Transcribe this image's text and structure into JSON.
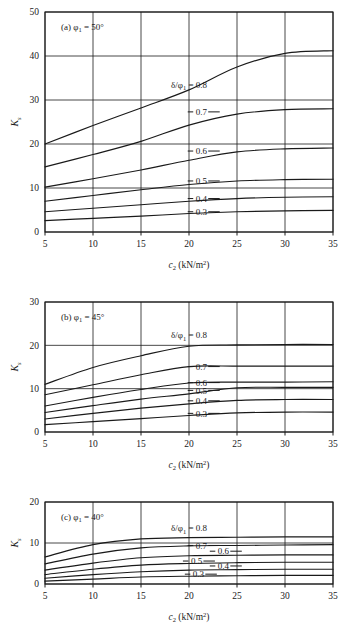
{
  "figure": {
    "panel_count": 3,
    "x_axis": {
      "label_main": "c",
      "label_sub": "2",
      "label_unit": "(kN/m",
      "label_unit_sup": "2",
      "label_unit_close": ")",
      "ticks": [
        5,
        10,
        15,
        20,
        25,
        30,
        35
      ],
      "min": 5,
      "max": 35
    },
    "y_axis": {
      "label_main": "K",
      "label_sub": "s"
    },
    "legend_prefix": "δ/φ",
    "legend_prefix_sub": "1",
    "legend_prefix_eq": " = 0.8",
    "ink_color": "#1a1a1a"
  },
  "chart_data": [
    {
      "type": "line",
      "panel": "a",
      "title": "(a) φ",
      "title_sub": "1",
      "title_rest": " = 50°",
      "xlabel": "c2 (kN/m2)",
      "ylabel": "Ks",
      "x": [
        5,
        10,
        15,
        20,
        25,
        30,
        35
      ],
      "xlim": [
        5,
        35
      ],
      "ylim": [
        0,
        50
      ],
      "yticks": [
        0,
        10,
        20,
        30,
        40,
        50
      ],
      "grid": true,
      "legend_position": "inline-right",
      "series": [
        {
          "name": "0.8",
          "label": "δ/φ₁ = 0.8",
          "values": [
            20.0,
            24.2,
            28.2,
            32.3,
            37.5,
            40.6,
            41.2
          ],
          "label_x": 20.0,
          "label_y": 33.5
        },
        {
          "name": "0.7",
          "label": "0.7",
          "values": [
            14.8,
            17.6,
            20.6,
            24.3,
            26.8,
            27.8,
            28.0
          ],
          "label_x": 20.7,
          "label_y": 27.3
        },
        {
          "name": "0.6",
          "label": "0.6",
          "values": [
            10.2,
            12.1,
            14.1,
            16.3,
            18.2,
            18.9,
            19.1
          ],
          "label_x": 20.7,
          "label_y": 18.4
        },
        {
          "name": "0.5",
          "label": "0.5",
          "values": [
            7.0,
            8.3,
            9.6,
            10.8,
            11.6,
            11.9,
            12.0
          ],
          "label_x": 20.7,
          "label_y": 11.6
        },
        {
          "name": "0.4",
          "label": "0.4",
          "values": [
            4.6,
            5.4,
            6.2,
            7.0,
            7.6,
            7.9,
            8.0
          ],
          "label_x": 20.7,
          "label_y": 7.6
        },
        {
          "name": "0.3",
          "label": "0.3",
          "values": [
            2.6,
            3.1,
            3.6,
            4.2,
            4.6,
            4.8,
            4.9
          ],
          "label_x": 20.7,
          "label_y": 4.6
        }
      ]
    },
    {
      "type": "line",
      "panel": "b",
      "title": "(b) φ",
      "title_sub": "1",
      "title_rest": " = 45°",
      "xlabel": "c2 (kN/m2)",
      "ylabel": "Ks",
      "x": [
        5,
        10,
        15,
        20,
        25,
        30,
        35
      ],
      "xlim": [
        5,
        35
      ],
      "ylim": [
        0,
        30
      ],
      "yticks": [
        0,
        10,
        20,
        30
      ],
      "grid": true,
      "legend_position": "inline-right",
      "series": [
        {
          "name": "0.8",
          "label": "δ/φ₁ = 0.8",
          "values": [
            11.0,
            14.9,
            17.6,
            19.8,
            20.1,
            20.2,
            20.2
          ],
          "label_x": 20.0,
          "label_y": 22.4
        },
        {
          "name": "0.7",
          "label": "0.7",
          "values": [
            8.6,
            10.9,
            13.2,
            15.1,
            15.2,
            15.2,
            15.2
          ],
          "label_x": 20.7,
          "label_y": 15.1
        },
        {
          "name": "0.6",
          "label": "0.6",
          "values": [
            6.0,
            8.0,
            9.8,
            11.3,
            11.5,
            11.5,
            11.6
          ],
          "label_x": 20.7,
          "label_y": 11.4
        },
        {
          "name": "0.5",
          "label": "0.5",
          "values": [
            4.5,
            6.1,
            7.6,
            8.8,
            10.2,
            10.3,
            10.3
          ],
          "label_x": 20.7,
          "label_y": 9.6
        },
        {
          "name": "0.4",
          "label": "0.4",
          "values": [
            3.0,
            4.3,
            5.5,
            6.5,
            7.3,
            7.5,
            7.5
          ],
          "label_x": 20.7,
          "label_y": 7.2
        },
        {
          "name": "0.3",
          "label": "0.3",
          "values": [
            1.7,
            2.4,
            3.1,
            3.8,
            4.4,
            4.6,
            4.6
          ],
          "label_x": 20.7,
          "label_y": 4.3
        }
      ]
    },
    {
      "type": "line",
      "panel": "c",
      "title": "(c) φ",
      "title_sub": "1",
      "title_rest": " = 40°",
      "xlabel": "c2 (kN/m2)",
      "ylabel": "Ks",
      "x": [
        5,
        10,
        15,
        20,
        25,
        30,
        35
      ],
      "xlim": [
        5,
        35
      ],
      "ylim": [
        0,
        20
      ],
      "yticks": [
        0,
        10,
        20
      ],
      "grid": true,
      "legend_position": "inline-right",
      "series": [
        {
          "name": "0.8",
          "label": "δ/φ₁ = 0.8",
          "values": [
            6.6,
            9.6,
            11.0,
            11.3,
            11.4,
            11.5,
            11.5
          ],
          "label_x": 20.0,
          "label_y": 13.6
        },
        {
          "name": "0.7",
          "label": "0.7",
          "values": [
            4.9,
            7.3,
            8.8,
            9.3,
            9.4,
            9.5,
            9.6
          ],
          "label_x": 20.7,
          "label_y": 9.4
        },
        {
          "name": "0.6",
          "label": "0.6",
          "values": [
            3.4,
            5.1,
            6.4,
            6.9,
            7.0,
            7.1,
            7.1
          ],
          "label_x": 23.0,
          "label_y": 8.0
        },
        {
          "name": "0.5",
          "label": "0.5",
          "values": [
            2.3,
            3.6,
            4.6,
            5.0,
            5.2,
            5.3,
            5.3
          ],
          "label_x": 20.2,
          "label_y": 5.6
        },
        {
          "name": "0.4",
          "label": "0.4",
          "values": [
            1.4,
            2.3,
            3.0,
            3.4,
            3.5,
            3.6,
            3.6
          ],
          "label_x": 23.0,
          "label_y": 4.4
        },
        {
          "name": "0.3",
          "label": "0.3",
          "values": [
            0.7,
            1.2,
            1.7,
            1.9,
            2.0,
            2.1,
            2.1
          ],
          "label_x": 20.4,
          "label_y": 2.4
        }
      ]
    }
  ]
}
